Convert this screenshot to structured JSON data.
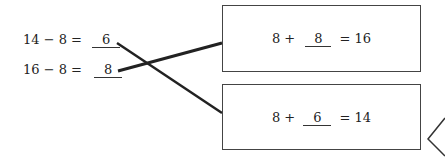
{
  "left_equations": [
    {
      "expr": "14 − 8 =",
      "answer": "6"
    },
    {
      "expr": "16 − 8 =",
      "answer": "8"
    }
  ],
  "right_boxes": [
    {
      "prefix": "8 +",
      "answer": "8",
      "suffix": "= 16"
    },
    {
      "prefix": "8 +",
      "answer": "6",
      "suffix": "= 14"
    }
  ],
  "connections": [
    {
      "from": "14 − 8",
      "to": "8 + 6 = 14"
    },
    {
      "from": "16 − 8",
      "to": "8 + 8 = 16"
    }
  ]
}
